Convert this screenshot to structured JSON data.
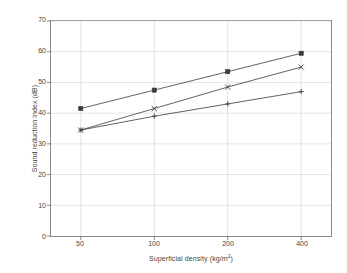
{
  "chart_data": {
    "type": "line",
    "title": "",
    "subtitle": "",
    "xlabel": "Superficial density (kg/m2)",
    "xlabel_base": "Superficial density (kg/m",
    "xlabel_sup": "2",
    "xlabel_tail": ")",
    "ylabel": "Sound reduction index (dB)",
    "categories": [
      "50",
      "100",
      "200",
      "400"
    ],
    "x": [
      50,
      100,
      200,
      400
    ],
    "xscale": "log",
    "xtick_labels": [
      "50",
      "100",
      "200",
      "400"
    ],
    "ytick_labels": [
      "0",
      "10",
      "20",
      "30",
      "40",
      "50",
      "60",
      "70"
    ],
    "yticks": [
      0,
      10,
      20,
      30,
      40,
      50,
      60,
      70
    ],
    "ylim": [
      0,
      70
    ],
    "grid": true,
    "grid_color": "#d6d6d6",
    "legend": "none",
    "line_color": "#3a3a3a",
    "series": [
      {
        "name": "series-1",
        "marker": "square",
        "values": [
          41.5,
          47.5,
          53.5,
          59.5
        ]
      },
      {
        "name": "series-2",
        "marker": "x",
        "values": [
          34.5,
          41.5,
          48.5,
          55.0
        ]
      },
      {
        "name": "series-3",
        "marker": "plus",
        "values": [
          34.5,
          39.0,
          43.0,
          47.0
        ]
      }
    ]
  }
}
